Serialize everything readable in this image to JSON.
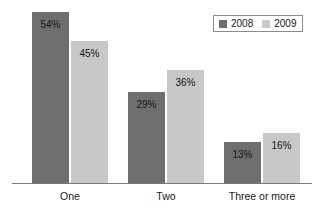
{
  "chart_data": {
    "type": "bar",
    "title": "",
    "subtitle": "",
    "xlabel": "",
    "ylabel": "",
    "ylim": [
      0,
      60
    ],
    "grid": false,
    "legend_position": "top-right",
    "categories": [
      "One",
      "Two",
      "Three or more"
    ],
    "series": [
      {
        "name": "2008",
        "color": "#6e6e6e",
        "values": [
          54,
          29,
          13
        ],
        "labels": [
          "54%",
          "29%",
          "13%"
        ]
      },
      {
        "name": "2009",
        "color": "#c8c8c8",
        "values": [
          45,
          36,
          16
        ],
        "labels": [
          "45%",
          "36%",
          "16%"
        ]
      }
    ]
  },
  "legend": {
    "entries": [
      {
        "label": "2008",
        "color": "#6e6e6e"
      },
      {
        "label": "2009",
        "color": "#c8c8c8"
      }
    ]
  },
  "axis": {
    "baseline_color": "#7a7a7a"
  },
  "categories": [
    {
      "label": "One"
    },
    {
      "label": "Two"
    },
    {
      "label": "Three or more"
    }
  ],
  "bars": [
    {
      "name": "bar-one-2008",
      "label": "54%",
      "series": "2008",
      "category": "One",
      "color": "#6e6e6e",
      "x": 32,
      "width": 37,
      "top": 12,
      "height": 171
    },
    {
      "name": "bar-one-2009",
      "label": "45%",
      "series": "2009",
      "category": "One",
      "color": "#c8c8c8",
      "x": 71,
      "width": 37,
      "top": 41,
      "height": 142
    },
    {
      "name": "bar-two-2008",
      "label": "29%",
      "series": "2008",
      "category": "Two",
      "color": "#6e6e6e",
      "x": 128,
      "width": 37,
      "top": 92,
      "height": 91
    },
    {
      "name": "bar-two-2009",
      "label": "36%",
      "series": "2009",
      "category": "Two",
      "color": "#c8c8c8",
      "x": 167,
      "width": 37,
      "top": 70,
      "height": 113
    },
    {
      "name": "bar-three-or-more-2008",
      "label": "13%",
      "series": "2008",
      "category": "Three or more",
      "color": "#6e6e6e",
      "x": 224,
      "width": 37,
      "top": 142,
      "height": 41
    },
    {
      "name": "bar-three-or-more-2009",
      "label": "16%",
      "series": "2009",
      "category": "Three or more",
      "color": "#c8c8c8",
      "x": 263,
      "width": 37,
      "top": 133,
      "height": 50
    }
  ],
  "category_positions": [
    {
      "label": "One",
      "x": 32,
      "width": 76
    },
    {
      "label": "Two",
      "x": 128,
      "width": 76
    },
    {
      "label": "Three or more",
      "x": 217,
      "width": 90
    }
  ]
}
